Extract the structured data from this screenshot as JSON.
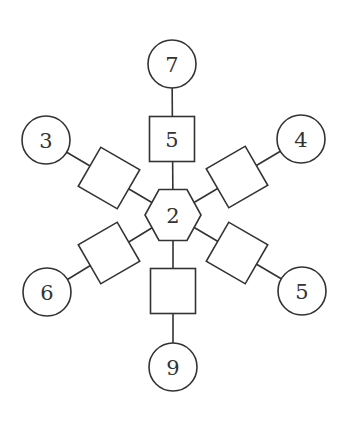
{
  "diagram": {
    "type": "puzzle-star",
    "stroke_color": "#333333",
    "background": "#ffffff",
    "center": {
      "shape": "hexagon",
      "label": "2",
      "x": 173,
      "y": 215
    },
    "spokes": [
      {
        "name": "up",
        "square": {
          "x": 172,
          "y": 139,
          "angle": 0,
          "label": "5"
        },
        "circle": {
          "x": 172,
          "y": 64,
          "label": "7"
        }
      },
      {
        "name": "upper-right",
        "square": {
          "x": 237,
          "y": 177,
          "angle": -30,
          "label": ""
        },
        "circle": {
          "x": 301,
          "y": 139,
          "label": "4"
        }
      },
      {
        "name": "lower-right",
        "square": {
          "x": 237,
          "y": 253,
          "angle": 30,
          "label": ""
        },
        "circle": {
          "x": 302,
          "y": 291,
          "label": "5"
        }
      },
      {
        "name": "down",
        "square": {
          "x": 173,
          "y": 291,
          "angle": 0,
          "label": ""
        },
        "circle": {
          "x": 173,
          "y": 367,
          "label": "9"
        }
      },
      {
        "name": "lower-left",
        "square": {
          "x": 109,
          "y": 253,
          "angle": -30,
          "label": ""
        },
        "circle": {
          "x": 47,
          "y": 292,
          "label": "6"
        }
      },
      {
        "name": "upper-left",
        "square": {
          "x": 109,
          "y": 178,
          "angle": 30,
          "label": ""
        },
        "circle": {
          "x": 46,
          "y": 140,
          "label": "3"
        }
      }
    ]
  }
}
